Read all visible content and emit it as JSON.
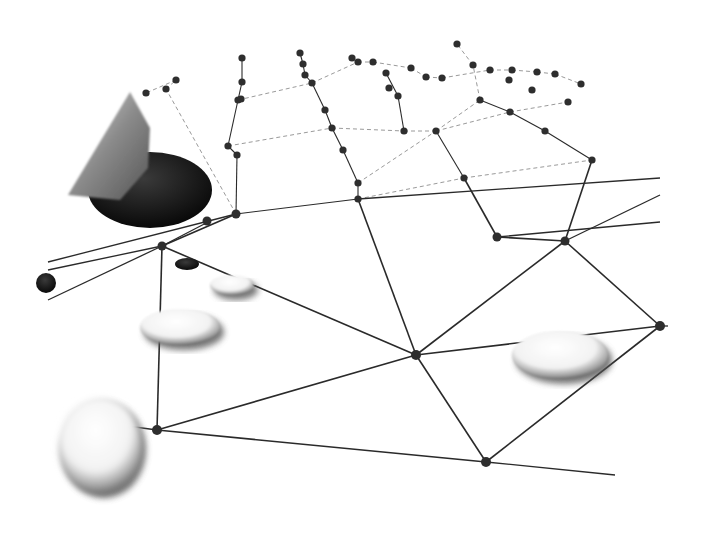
{
  "scene": {
    "description": "Perspective view of a board game played on an irregular planar graph; a hand places a black stone while white stones sit on the network",
    "background": "#ffffff",
    "line_color": "#2a2a2a",
    "node_color": "#2e2e2e"
  },
  "nodes": [
    [
      162,
      246
    ],
    [
      416,
      355
    ],
    [
      486,
      462
    ],
    [
      157,
      430
    ],
    [
      565,
      241
    ],
    [
      660,
      326
    ],
    [
      497,
      237
    ],
    [
      358,
      199
    ],
    [
      358,
      183
    ],
    [
      236,
      214
    ],
    [
      207,
      221
    ],
    [
      237,
      155
    ],
    [
      228,
      146
    ],
    [
      343,
      150
    ],
    [
      332,
      128
    ],
    [
      325,
      110
    ],
    [
      312,
      83
    ],
    [
      305,
      75
    ],
    [
      303,
      64
    ],
    [
      300,
      53
    ],
    [
      238,
      100
    ],
    [
      241,
      99
    ],
    [
      242,
      82
    ],
    [
      242,
      58
    ],
    [
      176,
      80
    ],
    [
      146,
      93
    ],
    [
      166,
      89
    ],
    [
      404,
      131
    ],
    [
      436,
      131
    ],
    [
      464,
      178
    ],
    [
      398,
      96
    ],
    [
      389,
      88
    ],
    [
      386,
      73
    ],
    [
      373,
      62
    ],
    [
      352,
      58
    ],
    [
      358,
      62
    ],
    [
      411,
      68
    ],
    [
      426,
      77
    ],
    [
      442,
      78
    ],
    [
      457,
      44
    ],
    [
      473,
      65
    ],
    [
      490,
      70
    ],
    [
      480,
      100
    ],
    [
      510,
      112
    ],
    [
      512,
      70
    ],
    [
      532,
      90
    ],
    [
      537,
      72
    ],
    [
      545,
      131
    ],
    [
      555,
      74
    ],
    [
      568,
      102
    ],
    [
      592,
      160
    ],
    [
      581,
      84
    ],
    [
      509,
      80
    ]
  ],
  "edges_solid": [
    [
      0,
      1
    ],
    [
      0,
      3
    ],
    [
      3,
      2
    ],
    [
      3,
      1
    ],
    [
      1,
      2
    ],
    [
      1,
      7
    ],
    [
      1,
      4
    ],
    [
      2,
      5
    ],
    [
      4,
      5
    ],
    [
      5,
      1
    ],
    [
      7,
      8
    ],
    [
      8,
      13
    ],
    [
      13,
      14
    ],
    [
      14,
      15
    ],
    [
      15,
      16
    ],
    [
      16,
      17
    ],
    [
      17,
      18
    ],
    [
      18,
      19
    ],
    [
      9,
      11
    ],
    [
      11,
      12
    ],
    [
      12,
      20
    ],
    [
      20,
      22
    ],
    [
      22,
      23
    ],
    [
      9,
      7
    ],
    [
      0,
      9
    ],
    [
      27,
      30
    ],
    [
      30,
      32
    ],
    [
      29,
      28
    ],
    [
      29,
      6
    ],
    [
      6,
      4
    ],
    [
      4,
      50
    ],
    [
      50,
      47
    ],
    [
      47,
      43
    ],
    [
      43,
      42
    ]
  ],
  "edges_dashed": [
    [
      9,
      26
    ],
    [
      26,
      24
    ],
    [
      24,
      25
    ],
    [
      12,
      14
    ],
    [
      14,
      27
    ],
    [
      27,
      28
    ],
    [
      28,
      43
    ],
    [
      43,
      49
    ],
    [
      7,
      29
    ],
    [
      29,
      50
    ],
    [
      8,
      28
    ],
    [
      28,
      42
    ],
    [
      42,
      40
    ],
    [
      40,
      39
    ],
    [
      20,
      16
    ],
    [
      16,
      35
    ],
    [
      35,
      33
    ],
    [
      33,
      36
    ],
    [
      36,
      37
    ],
    [
      37,
      38
    ],
    [
      38,
      41
    ],
    [
      41,
      44
    ],
    [
      44,
      46
    ],
    [
      46,
      48
    ],
    [
      48,
      51
    ]
  ],
  "stones": [
    {
      "color": "black",
      "x": 150,
      "y": 190,
      "rx": 62,
      "ry": 38,
      "held": true
    },
    {
      "color": "black",
      "x": 187,
      "y": 264,
      "rx": 12,
      "ry": 6
    },
    {
      "color": "black",
      "x": 46,
      "y": 283,
      "rx": 10,
      "ry": 10
    },
    {
      "color": "white",
      "x": 232,
      "y": 285,
      "rx": 22,
      "ry": 10
    },
    {
      "color": "white",
      "x": 180,
      "y": 327,
      "rx": 40,
      "ry": 18
    },
    {
      "color": "white",
      "x": 560,
      "y": 355,
      "rx": 48,
      "ry": 24
    },
    {
      "color": "white",
      "x": 100,
      "y": 445,
      "rx": 42,
      "ry": 48,
      "blurred": true
    }
  ]
}
